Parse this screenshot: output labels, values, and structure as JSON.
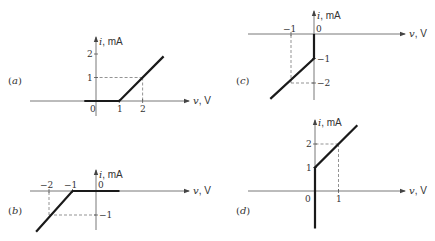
{
  "axis_labels": {
    "current_var": "i",
    "current_unit": ", mA",
    "voltage_var": "v",
    "voltage_unit": ", V"
  },
  "chart_data": [
    {
      "id": "a",
      "type": "line",
      "panel_label": "a",
      "xlabel": "v, V",
      "ylabel": "i, mA",
      "x_ticks": [
        "0",
        "1",
        "2"
      ],
      "y_ticks": [
        "1",
        "2"
      ],
      "points": [
        [
          -0.5,
          0
        ],
        [
          1,
          0
        ],
        [
          2.9,
          1.9
        ]
      ],
      "guides": [
        {
          "x": 2,
          "y": 1
        }
      ],
      "tick_labels": {
        "origin": "0",
        "x1": "1",
        "x2": "2",
        "y1": "1",
        "y2": "2"
      }
    },
    {
      "id": "b",
      "type": "line",
      "panel_label": "b",
      "xlabel": "v, V",
      "ylabel": "i, mA",
      "x_ticks": [
        "-2",
        "-1",
        "0"
      ],
      "y_ticks": [
        "-1"
      ],
      "points": [
        [
          -2.55,
          -1.7
        ],
        [
          -1,
          0
        ],
        [
          1,
          0
        ]
      ],
      "guides": [
        {
          "x": -2,
          "y": -1
        }
      ],
      "tick_labels": {
        "origin": "0",
        "xm1": "−1",
        "xm2": "−2",
        "ym1": "−1"
      }
    },
    {
      "id": "c",
      "type": "line",
      "panel_label": "c",
      "xlabel": "v, V",
      "ylabel": "i, mA",
      "x_ticks": [
        "-1",
        "0"
      ],
      "y_ticks": [
        "-1",
        "-2"
      ],
      "points": [
        [
          0,
          0
        ],
        [
          0,
          -1
        ],
        [
          -1.9,
          -2.65
        ]
      ],
      "guides": [
        {
          "x": -1,
          "y": -2
        }
      ],
      "tick_labels": {
        "origin": "0",
        "xm1": "−1",
        "ym1": "−1",
        "ym2": "−2"
      }
    },
    {
      "id": "d",
      "type": "line",
      "panel_label": "d",
      "xlabel": "v, V",
      "ylabel": "i, mA",
      "x_ticks": [
        "0",
        "1"
      ],
      "y_ticks": [
        "1",
        "2"
      ],
      "points": [
        [
          0,
          -1.6
        ],
        [
          0,
          1
        ],
        [
          1.8,
          2.8
        ]
      ],
      "guides": [
        {
          "x": 1,
          "y": 2
        }
      ],
      "tick_labels": {
        "origin": "0",
        "x1": "1",
        "y1": "1",
        "y2": "2"
      }
    }
  ]
}
